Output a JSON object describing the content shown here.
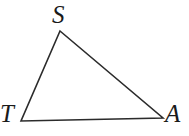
{
  "figure": {
    "kind": "geometry-diagram",
    "shape": "triangle",
    "background_color": "#ffffff",
    "stroke_color": "#2b2b2b",
    "stroke_width": 1.6,
    "canvas": {
      "width": 189,
      "height": 136
    },
    "vertices": [
      {
        "id": "S",
        "label": "S",
        "x": 60,
        "y": 31,
        "label_x": 52,
        "label_y": 2
      },
      {
        "id": "T",
        "label": "T",
        "x": 21,
        "y": 121,
        "label_x": 0,
        "label_y": 101
      },
      {
        "id": "A",
        "label": "A",
        "x": 163,
        "y": 118,
        "label_x": 165,
        "label_y": 101
      }
    ],
    "edges": [
      {
        "id": "ST",
        "from": "S",
        "to": "T"
      },
      {
        "id": "SA",
        "from": "S",
        "to": "A"
      },
      {
        "id": "TA",
        "from": "T",
        "to": "A"
      }
    ],
    "points_path": "60,31 163,118 21,121"
  }
}
